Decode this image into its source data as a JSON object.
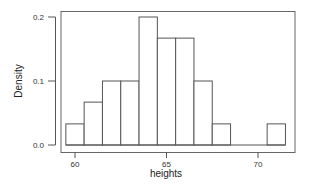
{
  "chart_data": {
    "type": "bar",
    "subtype": "histogram",
    "title": "",
    "xlabel": "heights",
    "ylabel": "Density",
    "bin_edges": [
      59.5,
      60.5,
      61.5,
      62.5,
      63.5,
      64.5,
      65.5,
      66.5,
      67.5,
      68.5,
      69.5,
      70.5,
      71.5
    ],
    "categories": [
      "59.5-60.5",
      "60.5-61.5",
      "61.5-62.5",
      "62.5-63.5",
      "63.5-64.5",
      "64.5-65.5",
      "65.5-66.5",
      "66.5-67.5",
      "67.5-68.5",
      "68.5-69.5",
      "69.5-70.5",
      "70.5-71.5"
    ],
    "values": [
      0.033,
      0.067,
      0.1,
      0.1,
      0.2,
      0.167,
      0.167,
      0.1,
      0.033,
      0,
      0,
      0.033
    ],
    "xlim": [
      59,
      72
    ],
    "ylim": [
      0,
      0.21
    ],
    "x_ticks": [
      60,
      65,
      70
    ],
    "x_tick_labels": [
      "60",
      "65",
      "70"
    ],
    "y_ticks": [
      0.0,
      0.1,
      0.2
    ],
    "y_tick_labels": [
      "0.0",
      "0.1",
      "0.2"
    ],
    "grid": false,
    "legend": null,
    "bar_fill": "#ffffff",
    "bar_stroke": "#555555"
  }
}
